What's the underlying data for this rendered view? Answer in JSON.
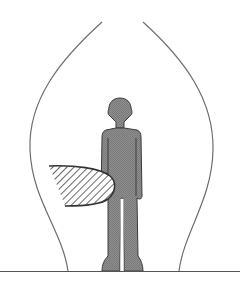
{
  "figure": {
    "title": "Person standing inside a bell-shaped envelope with a hatched object",
    "colors": {
      "background": "#ffffff",
      "envelope_stroke": "#6e6e6e",
      "ground_stroke": "#555555",
      "figure_fill": "#8a8a8a",
      "figure_stroke": "#3c3c3c",
      "hatch_stroke": "#6a6a6a",
      "hatch_outline": "#333333"
    },
    "elements": {
      "envelope": "envelope-curve",
      "ground": "ground-line",
      "person": "person-silhouette",
      "object": "hatched-object"
    }
  }
}
